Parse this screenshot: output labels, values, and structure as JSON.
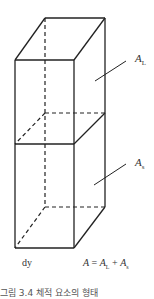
{
  "figure": {
    "type": "rectangular prism volume element (two stacked sections)",
    "labels": {
      "upper_area": {
        "symbol": "A",
        "subscript": "L"
      },
      "lower_area": {
        "symbol": "A",
        "subscript": "s"
      },
      "bottom_left": "dy",
      "equation": {
        "lhs": "A",
        "eq": " = ",
        "t1": "A",
        "t1_sub": "L",
        "plus": " + ",
        "t2": "A",
        "t2_sub": "s"
      }
    },
    "caption": "그림 3.4 체적 요소의 형태"
  },
  "colors": {
    "line": "#222222",
    "background": "#ffffff"
  }
}
